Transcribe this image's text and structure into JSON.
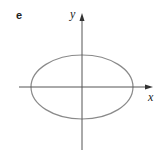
{
  "figure": {
    "panel_label": "e",
    "x_axis_label": "x",
    "y_axis_label": "y",
    "shape": "ellipse",
    "ellipse": {
      "cx": 82,
      "cy": 87,
      "rx": 51,
      "ry": 32
    },
    "colors": {
      "axis": "#555555",
      "curve": "#8a8a8a",
      "background": "#ffffff"
    }
  }
}
